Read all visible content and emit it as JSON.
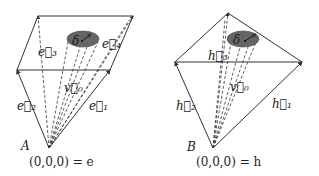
{
  "diagrams": [
    {
      "id": "A",
      "label": "A",
      "origin_label": "(0,0,0) = e",
      "edge_labels": {
        "e1": "e⃗₁",
        "e2": "e⃗₂",
        "e3": "e⃗₃",
        "e4": "e⃗₄"
      },
      "center_vector": "v⃗₀",
      "radius_label": "δ"
    },
    {
      "id": "B",
      "label": "B",
      "origin_label": "(0,0,0) = h",
      "edge_labels": {
        "h1": "h⃗₁",
        "h2": "h⃗₂",
        "h3": "h⃗₃"
      },
      "center_vector": "v⃗₀",
      "radius_label": "δ"
    }
  ],
  "colors": {
    "line": "#333333",
    "ellipse_fill": "#666666",
    "background": "#ffffff"
  }
}
